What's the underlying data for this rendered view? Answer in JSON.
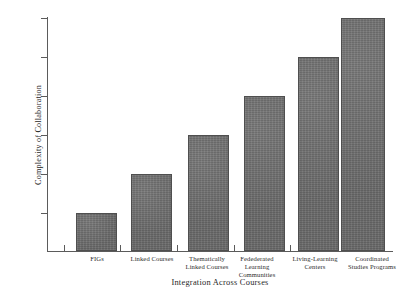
{
  "figure": {
    "title_partial": "",
    "background_color": "#ffffff",
    "bar_color": "#6e6e6e",
    "bar_border_color": "#4f4f4f",
    "axis_color": "#5b5b5b",
    "text_color": "#1f1f1f"
  },
  "chart_data": {
    "type": "bar",
    "title": "",
    "xlabel": "Integration Across Courses",
    "ylabel": "Complexity of Collaboration",
    "categories": [
      "FIGs",
      "Thematically Linked Courses",
      "Fedederated Learning Communities",
      "Living-Learning Centers",
      "Coordinated Studies Programs",
      "Linked Courses"
    ],
    "category_labels": [
      {
        "line1": "FIGs",
        "line2": "",
        "line3": ""
      },
      {
        "line1": "Linked Courses",
        "line2": "",
        "line3": ""
      },
      {
        "line1": "Thematically",
        "line2": "Linked Courses",
        "line3": ""
      },
      {
        "line1": "Fedederated",
        "line2": "Learning",
        "line3": "Communities"
      },
      {
        "line1": "Living-Learning",
        "line2": "Centers",
        "line3": ""
      },
      {
        "line1": "Coordinated",
        "line2": "Studies Programs",
        "line3": ""
      }
    ],
    "values": [
      1,
      2,
      3,
      4,
      5,
      6
    ],
    "ylim": [
      0,
      6
    ],
    "xlim": [
      0,
      6
    ],
    "y_tick_count": 6,
    "y_tick_labels": [
      "",
      "",
      "",
      "",
      "",
      ""
    ],
    "x_tick_labels_shown": false,
    "grid": false,
    "legend": null
  },
  "axes": {
    "y_ticks": [
      {
        "value": 6,
        "y": 18
      },
      {
        "value": 5,
        "y": 57
      },
      {
        "value": 4,
        "y": 96
      },
      {
        "value": 3,
        "y": 135
      },
      {
        "value": 2,
        "y": 174
      },
      {
        "value": 1,
        "y": 213
      }
    ],
    "x_boundary_ticks": [
      64,
      120,
      177,
      234,
      290,
      337,
      384
    ]
  },
  "bars": [
    {
      "name": "figs",
      "x": 76,
      "width": 41,
      "top": 213,
      "value": 1
    },
    {
      "name": "linked-courses",
      "x": 131,
      "width": 41,
      "top": 174,
      "value": 2
    },
    {
      "name": "thematically-linked-courses",
      "x": 188,
      "width": 41,
      "top": 135,
      "value": 3
    },
    {
      "name": "fedederated-learning-communities",
      "x": 244,
      "width": 41,
      "top": 96,
      "value": 4
    },
    {
      "name": "living-learning-centers",
      "x": 298,
      "width": 41,
      "top": 57,
      "value": 5
    },
    {
      "name": "coordinated-studies-programs",
      "x": 341,
      "width": 44,
      "top": 18,
      "value": 6
    }
  ],
  "label_boxes": [
    {
      "left": 70,
      "width": 54
    },
    {
      "left": 122,
      "width": 60
    },
    {
      "left": 176,
      "width": 62
    },
    {
      "left": 228,
      "width": 58
    },
    {
      "left": 282,
      "width": 66
    },
    {
      "left": 336,
      "width": 72
    }
  ]
}
